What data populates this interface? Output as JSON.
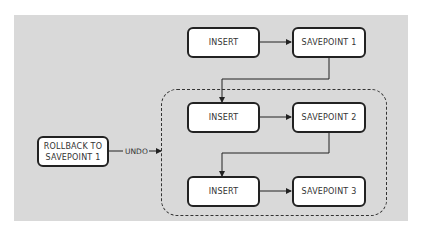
{
  "diagram": {
    "nodes": {
      "insert1": "INSERT",
      "savepoint1": "SAVEPOINT 1",
      "insert2": "INSERT",
      "savepoint2": "SAVEPOINT 2",
      "insert3": "INSERT",
      "savepoint3": "SAVEPOINT 3",
      "rollback_line1": "ROLLBACK TO",
      "rollback_line2": "SAVEPOINT 1"
    },
    "edge_labels": {
      "undo": "UNDO"
    },
    "colors": {
      "background": "#d9d9d9",
      "box_fill": "#ffffff",
      "stroke": "#222222"
    }
  }
}
